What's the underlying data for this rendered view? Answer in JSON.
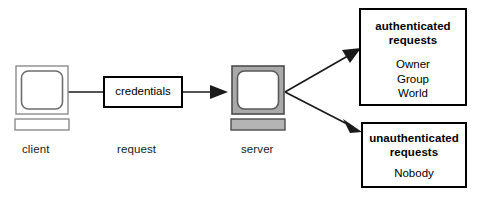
{
  "diagram": {
    "colors": {
      "line": "#1a1a1a",
      "box_border": "#000000",
      "monitor_grey": "#a9a9a9",
      "monitor_grey_light": "#c6c6c6",
      "screen_white": "#ffffff",
      "background": "#ffffff"
    },
    "nodes": [
      {
        "id": "client",
        "kind": "monitor",
        "label": "client",
        "shaded": false
      },
      {
        "id": "credentials",
        "kind": "box",
        "label": "credentials"
      },
      {
        "id": "server",
        "kind": "monitor",
        "label": "server",
        "shaded": true
      }
    ],
    "edge_labels": [
      {
        "id": "request",
        "text": "request"
      }
    ],
    "result_boxes": [
      {
        "id": "authenticated",
        "title_line_1": "authenticated",
        "title_line_2": "requests",
        "items": [
          "Owner",
          "Group",
          "World"
        ]
      },
      {
        "id": "unauthenticated",
        "title_line_1": "unauthenticated",
        "title_line_2": "requests",
        "items": [
          "Nobody"
        ]
      }
    ],
    "connections": [
      {
        "id": "client-to-credentials",
        "from": "client",
        "to": "credentials",
        "arrow": false
      },
      {
        "id": "credentials-to-server",
        "from": "credentials",
        "to": "server",
        "arrow": true
      },
      {
        "id": "server-to-authenticated",
        "from": "server",
        "to": "authenticated",
        "arrow": true
      },
      {
        "id": "server-to-unauthenticated",
        "from": "server",
        "to": "unauthenticated",
        "arrow": true
      }
    ]
  }
}
